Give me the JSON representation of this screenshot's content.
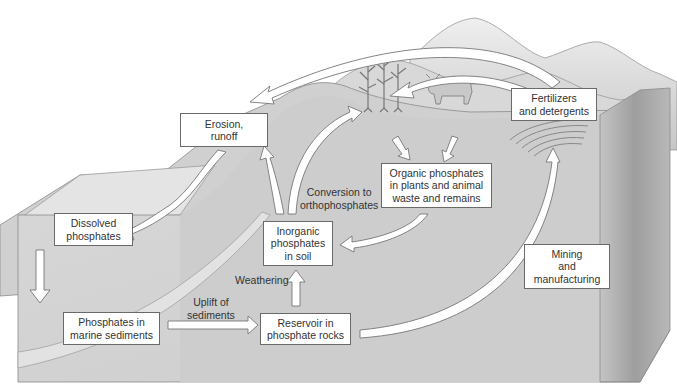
{
  "diagram": {
    "nodes": [
      {
        "id": "erosion",
        "lines": [
          "Erosion,",
          "runoff"
        ]
      },
      {
        "id": "fertilizers",
        "lines": [
          "Fertilizers",
          "and detergents"
        ]
      },
      {
        "id": "dissolved",
        "lines": [
          "Dissolved",
          "phosphates"
        ]
      },
      {
        "id": "organic",
        "lines": [
          "Organic phosphates",
          "in plants and animal",
          "waste and remains"
        ]
      },
      {
        "id": "inorganic",
        "lines": [
          "Inorganic",
          "phosphates",
          "in soil"
        ]
      },
      {
        "id": "marine",
        "lines": [
          "Phosphates in",
          "marine sediments"
        ]
      },
      {
        "id": "reservoir",
        "lines": [
          "Reservoir in",
          "phosphate rocks"
        ]
      },
      {
        "id": "mining",
        "lines": [
          "Mining",
          "and",
          "manufacturing"
        ]
      }
    ],
    "edge_labels": {
      "conversion": [
        "Conversion to",
        "orthophosphates"
      ],
      "weathering": "Weathering",
      "uplift": [
        "Uplift of",
        "sediments"
      ]
    },
    "edges": [
      {
        "from": "fertilizers",
        "to": "erosion"
      },
      {
        "from": "fertilizers",
        "to": "organic",
        "note": "to plants"
      },
      {
        "from": "erosion",
        "to": "dissolved"
      },
      {
        "from": "dissolved",
        "to": "marine"
      },
      {
        "from": "marine",
        "to": "reservoir",
        "label": "Uplift of sediments"
      },
      {
        "from": "reservoir",
        "to": "inorganic",
        "label": "Weathering"
      },
      {
        "from": "inorganic",
        "to": "erosion"
      },
      {
        "from": "inorganic",
        "to": "organic",
        "label": "Conversion to orthophosphates"
      },
      {
        "from": "organic",
        "to": "inorganic"
      },
      {
        "from": "reservoir",
        "to": "fertilizers",
        "label": "Mining and manufacturing"
      }
    ],
    "colors": {
      "background": "#ffffff",
      "block_front": "#d4d4d4",
      "block_top": "#dcdcdc",
      "block_side": "#a9a9a9",
      "mountains": "#cfcfcf",
      "box_border": "#6a6a6a",
      "arrow_fill": "#ffffff",
      "arrow_stroke": "#777777"
    }
  }
}
